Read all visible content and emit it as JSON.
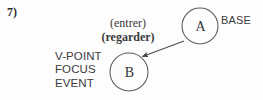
{
  "figure": {
    "item_number": "7)",
    "width": 263,
    "height": 100,
    "background_color": "#fdfdfd",
    "stroke_color": "#4a4a4a",
    "text_color": "#3a3a3a"
  },
  "nodes": [
    {
      "id": "a",
      "letter": "A",
      "label": "BASE",
      "cx": 200,
      "cy": 26,
      "r": 18
    },
    {
      "id": "b",
      "letter": "B",
      "cx": 129,
      "cy": 72,
      "r": 19
    }
  ],
  "arrow": {
    "from_node": "A",
    "to_node": "B",
    "x1": 184,
    "y1": 41,
    "x2": 141,
    "y2": 57,
    "head": "solid-triangle"
  },
  "verbs": {
    "entrer": "(entrer)",
    "regarder": "(regarder)"
  },
  "roles": {
    "line1": "V-POINT",
    "line2": "FOCUS",
    "line3": "EVENT"
  }
}
